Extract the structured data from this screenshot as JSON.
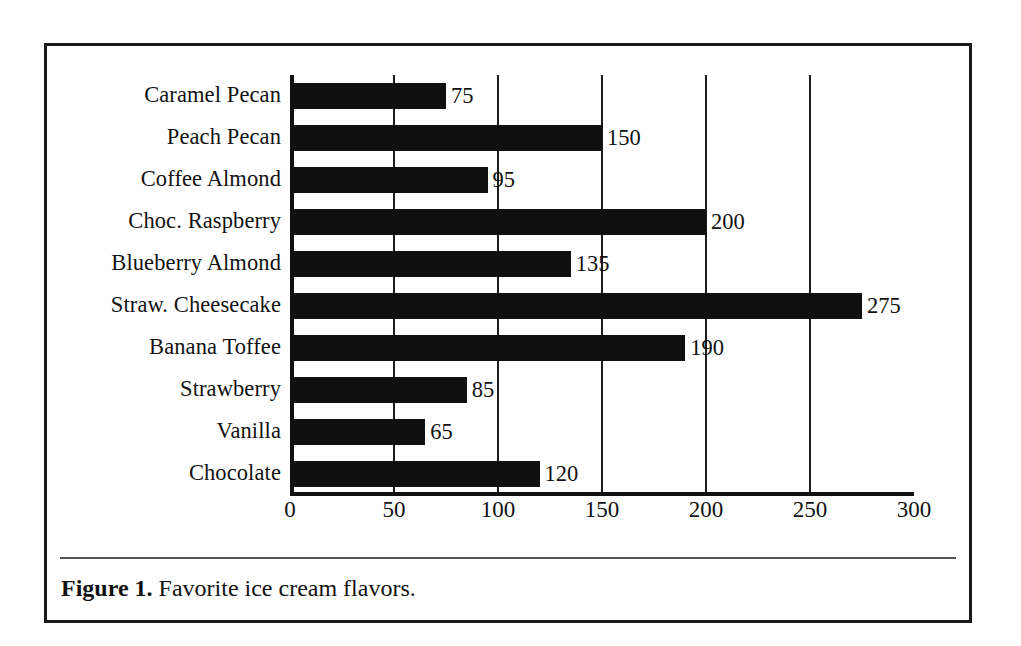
{
  "figure": {
    "caption_label": "Figure 1.",
    "caption_text": "Favorite ice cream flavors.",
    "frame_color": "#1a1a1a",
    "bar_color": "#101010",
    "background_color": "#ffffff",
    "rule_color": "#555555"
  },
  "chart_data": {
    "type": "bar",
    "orientation": "horizontal",
    "title": "",
    "xlabel": "",
    "ylabel": "",
    "xlim": [
      0,
      300
    ],
    "ylim": null,
    "grid": true,
    "grid_axis": "x",
    "legend": false,
    "legend_position": "none",
    "data_labels": true,
    "categories": [
      "Caramel Pecan",
      "Peach Pecan",
      "Coffee Almond",
      "Choc. Raspberry",
      "Blueberry Almond",
      "Straw. Cheesecake",
      "Banana Toffee",
      "Strawberry",
      "Vanilla",
      "Chocolate"
    ],
    "values": [
      75,
      150,
      95,
      200,
      135,
      275,
      190,
      85,
      65,
      120
    ],
    "value_labels": [
      "75",
      "150",
      "95",
      "200",
      "135",
      "275",
      "190",
      "85",
      "65",
      "120"
    ],
    "xticks": [
      0,
      50,
      100,
      150,
      200,
      250,
      300
    ],
    "xtick_labels": [
      "0",
      "50",
      "100",
      "150",
      "200",
      "250",
      "300"
    ],
    "gridline_values": [
      50,
      100,
      150,
      200,
      250
    ]
  }
}
